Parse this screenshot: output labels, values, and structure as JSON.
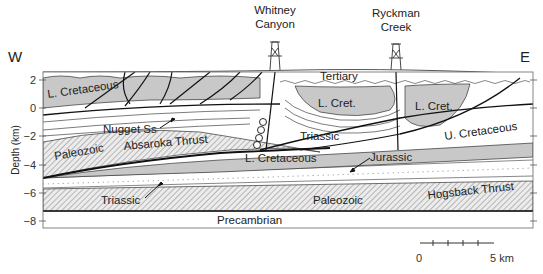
{
  "figure": {
    "direction_left": "W",
    "direction_right": "E",
    "wells": [
      {
        "name_line1": "Whitney",
        "name_line2": "Canyon"
      },
      {
        "name_line1": "Ryckman",
        "name_line2": "Creek"
      }
    ],
    "y_axis": {
      "label": "Depth (km)",
      "ticks": [
        "2",
        "0",
        "−2",
        "−4",
        "−6",
        "−8"
      ]
    },
    "units": [
      {
        "id": "tertiary",
        "label": "Tertiary"
      },
      {
        "id": "l-cretaceous-west",
        "label": "L. Cretaceous"
      },
      {
        "id": "l-cret-center",
        "label": "L. Cret."
      },
      {
        "id": "l-cret-east",
        "label": "L. Cret."
      },
      {
        "id": "u-cretaceous",
        "label": "U. Cretaceous"
      },
      {
        "id": "nugget-ss",
        "label": "Nugget Ss"
      },
      {
        "id": "triassic-upper",
        "label": "Triassic"
      },
      {
        "id": "paleozoic-upper",
        "label": "Paleozoic"
      },
      {
        "id": "l-cretaceous-lower",
        "label": "L. Cretaceous"
      },
      {
        "id": "jurassic",
        "label": "Jurassic"
      },
      {
        "id": "triassic-lower",
        "label": "Triassic"
      },
      {
        "id": "paleozoic-lower",
        "label": "Paleozoic"
      },
      {
        "id": "precambrian",
        "label": "Precambrian"
      }
    ],
    "faults": [
      {
        "id": "absaroka-thrust",
        "label": "Absaroka Thrust"
      },
      {
        "id": "hogsback-thrust",
        "label": "Hogsback Thrust"
      }
    ],
    "scale_bar": {
      "start": "0",
      "end": "5 km"
    },
    "colors": {
      "gray_fill": "#c8c8c8",
      "hatch": "#7a7a7a",
      "line": "#1a1a1a"
    }
  }
}
